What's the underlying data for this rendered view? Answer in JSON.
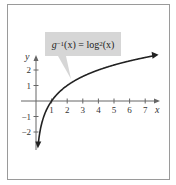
{
  "chart_data": {
    "type": "line",
    "title": "",
    "annotation": "g^{-1}(x) = log_2(x)",
    "function": "log2(x)",
    "xlabel": "x",
    "ylabel": "y",
    "x_ticks": [
      1,
      2,
      3,
      4,
      5,
      6,
      7
    ],
    "y_ticks": [
      -2,
      -1,
      1,
      2
    ],
    "xlim": [
      -0.8,
      8
    ],
    "ylim": [
      -3.5,
      3
    ],
    "grid": false,
    "series": [
      {
        "name": "g^{-1}(x) = log_2(x)",
        "x": [
          0.125,
          0.25,
          0.5,
          1,
          2,
          3,
          4,
          5,
          6,
          7,
          8
        ],
        "values": [
          -3,
          -2,
          -1,
          0,
          1,
          1.585,
          2,
          2.322,
          2.585,
          2.807,
          3
        ]
      }
    ]
  },
  "label": {
    "g": "g",
    "sup": "−1",
    "mid": "(x) = log",
    "sub": "2",
    "end": "(x)"
  },
  "axes": {
    "x_label": "x",
    "y_label": "y",
    "x_ticks": [
      "1",
      "2",
      "3",
      "4",
      "5",
      "6",
      "7"
    ],
    "y_ticks": [
      "2",
      "1",
      "−1",
      "−2"
    ]
  }
}
